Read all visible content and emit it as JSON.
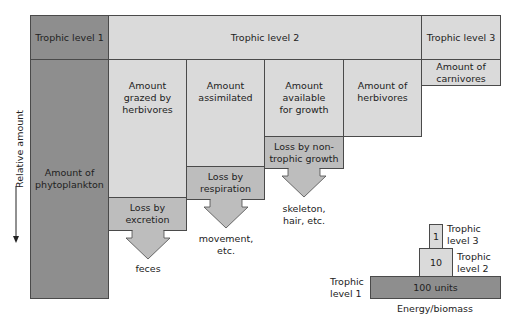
{
  "header": {
    "level1": "Trophic level 1",
    "level2": "Trophic level 2",
    "level3": "Trophic level 3"
  },
  "boxes": {
    "phytoplankton": "Amount of phytoplankton",
    "grazed": "Amount grazed by herbivores",
    "assimilated": "Amount assimilated",
    "available": "Amount available for growth",
    "herbivores": "Amount of herbivores",
    "carnivores": "Amount of carnivores"
  },
  "losses": {
    "excretion": {
      "label": "Loss by excretion",
      "output": "feces"
    },
    "respiration": {
      "label": "Loss by respiration",
      "output": "movement, etc."
    },
    "nontrophic": {
      "label": "Loss by non-trophic growth",
      "output": "skeleton, hair, etc."
    }
  },
  "axis": {
    "label": "Relative amount"
  },
  "pyramid": {
    "level1": {
      "value": "100 units",
      "label": "Trophic level 1"
    },
    "level2": {
      "value": "10",
      "label": "Trophic level 2"
    },
    "level3": {
      "value": "1",
      "label": "Trophic level 3"
    },
    "caption": "Energy/biomass"
  },
  "colors": {
    "level1": "#8e8e8e",
    "level2_boxes": "#dadada",
    "loss_boxes": "#bdbdbd",
    "border": "#4a4a4a"
  }
}
